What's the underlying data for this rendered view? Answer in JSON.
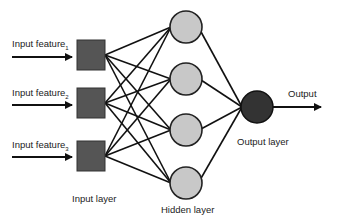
{
  "diagram": {
    "type": "neural-network",
    "colors": {
      "input_node": "#555555",
      "hidden_node": "#c8c8c8",
      "output_node": "#333333",
      "edge": "#111111",
      "text": "#222222"
    },
    "inputs": [
      {
        "label": "Input feature",
        "subscript": "1"
      },
      {
        "label": "Input feature",
        "subscript": "2"
      },
      {
        "label": "Input feature",
        "subscript": "3"
      }
    ],
    "layers": {
      "input": {
        "label": "Input layer",
        "nodes": 3
      },
      "hidden": {
        "label": "Hidden layer",
        "nodes": 4
      },
      "output": {
        "label": "Output layer",
        "nodes": 1
      }
    },
    "output_label": "Output"
  }
}
